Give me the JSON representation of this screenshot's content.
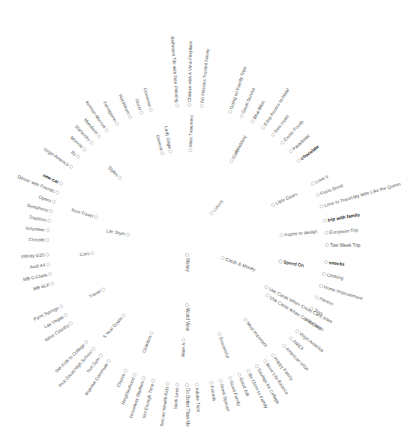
{
  "diagram": {
    "type": "radial-tree",
    "center": {
      "x": 187,
      "y": 245
    },
    "root": {
      "label": "Money",
      "angle": 90,
      "r": 10
    },
    "branches": [
      {
        "label": "Cards & Money",
        "angle": 20,
        "r": 38,
        "children": [
          {
            "label": "Speed On",
            "angle": 10,
            "r": 95,
            "bold": false
          },
          {
            "label": "Use Cards When Credit Card Sites",
            "angle": 28,
            "r": 90
          }
        ]
      },
      {
        "label": "Luxury",
        "angle": -52,
        "r": 40,
        "children": []
      },
      {
        "label": "Gallbladdery",
        "angle": -62,
        "r": 95,
        "children": [
          {
            "label": "Going on Family Trips",
            "angle": -72,
            "r": 140
          },
          {
            "label": "Great Service",
            "angle": -67,
            "r": 140
          },
          {
            "label": "Blue Bliss",
            "angle": -62,
            "r": 140
          },
          {
            "label": "Easy Access to Hotel",
            "angle": -57,
            "r": 140
          },
          {
            "label": "New Hotel",
            "angle": -52,
            "r": 140
          },
          {
            "label": "Exotic Foods",
            "angle": -47,
            "r": 140
          },
          {
            "label": "Paradisiac",
            "angle": -42,
            "r": 140
          },
          {
            "label": "chocolate",
            "angle": -37,
            "r": 140,
            "bold": true
          }
        ]
      },
      {
        "label": "Little Gears",
        "angle": -25,
        "r": 95,
        "children": [
          {
            "label": "Love it",
            "angle": -26,
            "r": 140
          },
          {
            "label": "Feels Great",
            "angle": -21,
            "r": 140
          },
          {
            "label": "Love to Travel My Wife Like the Queen",
            "angle": -16,
            "r": 140
          }
        ]
      },
      {
        "label": "Aspire to design",
        "angle": -6,
        "r": 95,
        "children": [
          {
            "label": "trip with family",
            "angle": -10,
            "r": 140,
            "bold": true
          },
          {
            "label": "European Trip",
            "angle": -5,
            "r": 140
          },
          {
            "label": "Two Week Trip",
            "angle": 0,
            "r": 140
          }
        ]
      },
      {
        "label": "Speed On",
        "angle": 10,
        "r": 95,
        "children": [
          {
            "label": "snacks",
            "angle": 7,
            "r": 140,
            "bold": true
          },
          {
            "label": "Clothing",
            "angle": 12,
            "r": 140
          },
          {
            "label": "Home Improvement",
            "angle": 17,
            "r": 140
          },
          {
            "label": "Fitness",
            "angle": 22,
            "r": 140
          },
          {
            "label": "Toys",
            "angle": 27,
            "r": 140
          },
          {
            "label": "Vacation",
            "angle": 32,
            "r": 140
          }
        ]
      },
      {
        "label": "Use Cards When Credit Card",
        "angle": 32,
        "r": 95,
        "children": [
          {
            "label": "Virgin America",
            "angle": 38,
            "r": 140
          },
          {
            "label": "AMEX",
            "angle": 42,
            "r": 140
          },
          {
            "label": "American VISA",
            "angle": 46,
            "r": 140
          }
        ]
      },
      {
        "label": "Most Important",
        "angle": 52,
        "r": 95,
        "children": [
          {
            "label": "Happy Family",
            "angle": 52,
            "r": 140
          },
          {
            "label": "More Life Balance",
            "angle": 56,
            "r": 140
          },
          {
            "label": "Savings for College",
            "angle": 60,
            "r": 140
          },
          {
            "label": "Be Close to Family",
            "angle": 64,
            "r": 140
          }
        ]
      },
      {
        "label": "Successful",
        "angle": 70,
        "r": 95,
        "children": [
          {
            "label": "Good Job",
            "angle": 68,
            "r": 140
          },
          {
            "label": "Good Family",
            "angle": 72,
            "r": 140
          },
          {
            "label": "Great Spouse",
            "angle": 76,
            "r": 140
          },
          {
            "label": "Friends",
            "angle": 80,
            "r": 140
          }
        ]
      },
      {
        "label": "World View",
        "angle": 90,
        "r": 60,
        "children": []
      },
      {
        "label": "Wide A",
        "angle": 92,
        "r": 95,
        "children": [
          {
            "label": "Adobe Trips",
            "angle": 86,
            "r": 140
          },
          {
            "label": "Do Better Than Me",
            "angle": 90,
            "r": 140
          },
          {
            "label": "Work Less",
            "angle": 94,
            "r": 140
          },
          {
            "label": "Secure Wealth Kids",
            "angle": 98,
            "r": 140
          }
        ]
      },
      {
        "label": "Charities",
        "angle": 112,
        "r": 95,
        "children": [
          {
            "label": "Not Enough Time",
            "angle": 104,
            "r": 140
          },
          {
            "label": "Homeless Shelters",
            "angle": 108,
            "r": 140
          },
          {
            "label": "Neighborhood",
            "angle": 112,
            "r": 140
          },
          {
            "label": "Church",
            "angle": 116,
            "r": 140
          }
        ]
      },
      {
        "label": "5 Year Goals",
        "angle": 132,
        "r": 95,
        "children": [
          {
            "label": "Improve Commute",
            "angle": 124,
            "r": 140
          },
          {
            "label": "Nut Gym",
            "angle": 128,
            "r": 140
          },
          {
            "label": "Pick Great High School",
            "angle": 132,
            "r": 140
          },
          {
            "label": "Get Kids to College",
            "angle": 136,
            "r": 140
          }
        ]
      },
      {
        "label": "Travel",
        "angle": 152,
        "r": 95,
        "children": [
          {
            "label": "Wine Country",
            "angle": 146,
            "r": 140
          },
          {
            "label": "Las Vegas",
            "angle": 150,
            "r": 140
          },
          {
            "label": "Palm Springs",
            "angle": 154,
            "r": 140
          }
        ]
      },
      {
        "label": "Cars",
        "angle": 175,
        "r": 95,
        "children": [
          {
            "label": "MB SLK",
            "angle": 164,
            "r": 140
          },
          {
            "label": "MB C-Class",
            "angle": 168,
            "r": 140
          },
          {
            "label": "Audi A4",
            "angle": 172,
            "r": 140
          },
          {
            "label": "Infinity G35",
            "angle": 176,
            "r": 140
          }
        ]
      },
      {
        "label": "Life Style",
        "angle": 190,
        "r": 60,
        "children": []
      },
      {
        "label": "Non-Travel",
        "angle": 197,
        "r": 95,
        "children": [
          {
            "label": "Crossfit",
            "angle": 182,
            "r": 140
          },
          {
            "label": "Volunteer",
            "angle": 186,
            "r": 140
          },
          {
            "label": "Triathlon",
            "angle": 190,
            "r": 140
          },
          {
            "label": "Symphony",
            "angle": 194,
            "r": 140
          },
          {
            "label": "Opera",
            "angle": 198,
            "r": 140
          },
          {
            "label": "Dinner with Friends",
            "angle": 202,
            "r": 140
          },
          {
            "label": "new car",
            "angle": 206,
            "r": 140,
            "bold": true
          }
        ]
      },
      {
        "label": "Styles",
        "angle": 225,
        "r": 95,
        "children": [
          {
            "label": "Virgin America",
            "angle": 214,
            "r": 140
          },
          {
            "label": "Illy",
            "angle": 219,
            "r": 140
          },
          {
            "label": "Monroe",
            "angle": 223,
            "r": 140
          },
          {
            "label": "Starbucks",
            "angle": 227,
            "r": 140
          },
          {
            "label": "Mandarin",
            "angle": 231,
            "r": 140
          },
          {
            "label": "Neiman Marcus",
            "angle": 235,
            "r": 140
          },
          {
            "label": "Ferragamo",
            "angle": 240,
            "r": 140
          },
          {
            "label": "Nordstrom",
            "angle": 246,
            "r": 140
          },
          {
            "label": "Gucci",
            "angle": 251,
            "r": 140
          },
          {
            "label": "Converse",
            "angle": 255,
            "r": 140
          }
        ]
      },
      {
        "label": "Lady Gaga",
        "angle": 260,
        "r": 95,
        "children": []
      },
      {
        "label": "Geneva",
        "angle": 255,
        "r": 95,
        "children": []
      },
      {
        "label": "Most Treatment",
        "angle": 272,
        "r": 95,
        "children": [
          {
            "label": "Bathroom Tile with Nice Flooring",
            "angle": 266,
            "r": 140
          },
          {
            "label": "Chicken with A View Fireplace",
            "angle": 271,
            "r": 140
          },
          {
            "label": "No Hassles Trusted Nanny",
            "angle": 276,
            "r": 140
          }
        ]
      }
    ]
  }
}
